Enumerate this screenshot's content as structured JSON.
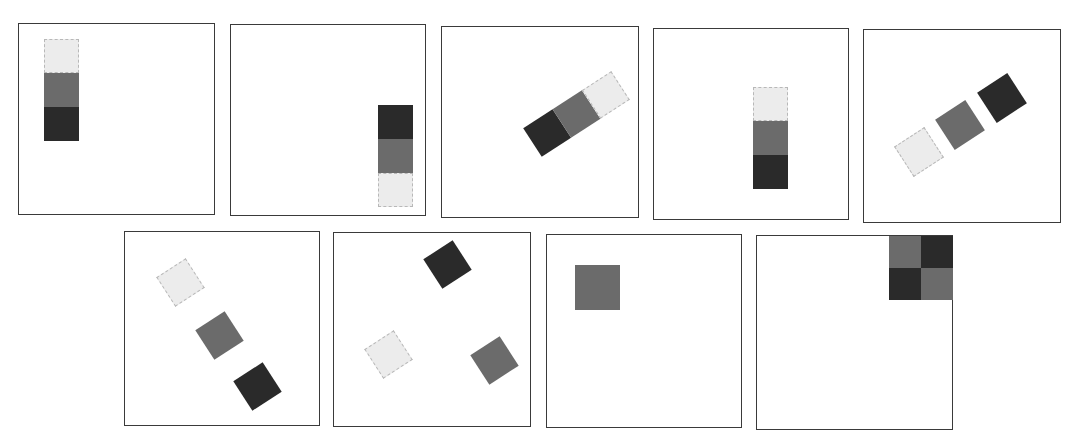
{
  "figure": {
    "caption_fragment": "",
    "colors": {
      "light": "#ececec",
      "mid": "#6b6b6b",
      "dark": "#2a2a2a",
      "frame": "#3a3a3a"
    },
    "panels": [
      {
        "id": 1,
        "description": "vertical stack top-left: light, mid, dark"
      },
      {
        "id": 2,
        "description": "vertical stack right: dark, mid, light"
      },
      {
        "id": 3,
        "description": "rotated stack: dark, mid, light diagonal"
      },
      {
        "id": 4,
        "description": "vertical stack center: light, mid, dark"
      },
      {
        "id": 5,
        "description": "three separated rotated squares: light, mid, dark"
      },
      {
        "id": 6,
        "description": "three separated rotated squares diagonal down: light, mid, dark"
      },
      {
        "id": 7,
        "description": "three scattered rotated squares: dark top, light left, mid right"
      },
      {
        "id": 8,
        "description": "single mid square top-left"
      },
      {
        "id": 9,
        "description": "2x2 checker top-right: mid, dark / dark, mid"
      }
    ]
  }
}
